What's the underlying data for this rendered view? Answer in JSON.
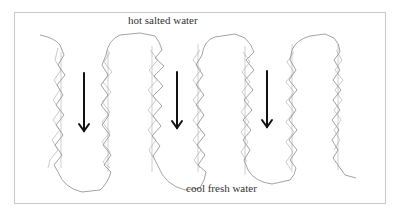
{
  "diagram": {
    "type": "flow-diagram",
    "labels": {
      "top": "hot salted water",
      "bottom": "cool fresh water"
    },
    "arrows": [
      {
        "direction": "down",
        "x": 84,
        "y_start": 73,
        "y_end": 131
      },
      {
        "direction": "down",
        "x": 177,
        "y_start": 72,
        "y_end": 128
      },
      {
        "direction": "down",
        "x": 267,
        "y_start": 71,
        "y_end": 127
      }
    ],
    "colors": {
      "channel_line": "#8c8c8c",
      "arrow": "#111111",
      "frame": "#c8c8c8",
      "text": "#333333"
    }
  }
}
